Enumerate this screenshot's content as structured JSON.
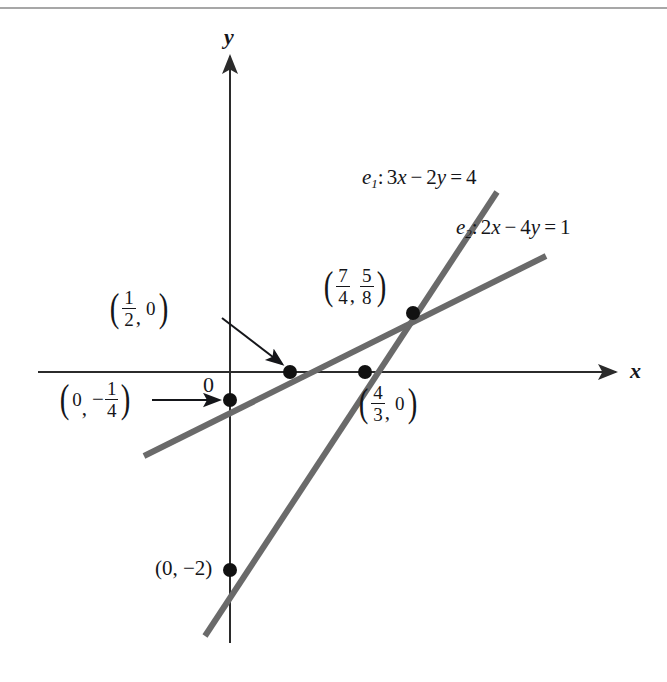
{
  "figure": {
    "type": "coordinate-geometry-diagram",
    "width": 667,
    "height": 682,
    "background": "#ffffff",
    "line_color": "#6a6a6a",
    "axis_color": "#2b2b2b",
    "point_color": "#111111",
    "text_color": "#15161a"
  },
  "axes": {
    "x_label": "x",
    "y_label": "y",
    "origin_label": "0",
    "origin_px": {
      "x": 230,
      "y": 372
    },
    "x_axis_px": {
      "x1": 38,
      "y1": 372,
      "x2": 620,
      "y2": 372
    },
    "y_axis_px": {
      "x1": 230,
      "y1": 52,
      "x2": 230,
      "y2": 643
    }
  },
  "lines": [
    {
      "id": "e1",
      "name": "e_1",
      "subscript": "1",
      "equation_parts": {
        "coef_x": "3",
        "var_x": "x",
        "operator": "−",
        "coef_y": "2",
        "var_y": "y",
        "equals": "=",
        "rhs": "4"
      },
      "equation_text": "e₁: 3x − 2y = 4",
      "label_px": {
        "x": 362,
        "y": 178
      },
      "endpoints_px": {
        "x1": 205,
        "y1": 636,
        "x2": 497,
        "y2": 192
      }
    },
    {
      "id": "e2",
      "name": "e_2",
      "subscript": "2",
      "equation_parts": {
        "coef_x": "2",
        "var_x": "x",
        "operator": "−",
        "coef_y": "4",
        "var_y": "y",
        "equals": "=",
        "rhs": "1"
      },
      "equation_text": "e₂: 2x − 4y = 1",
      "label_px": {
        "x": 456,
        "y": 228
      },
      "endpoints_px": {
        "x1": 144,
        "y1": 456,
        "x2": 546,
        "y2": 256
      }
    }
  ],
  "points": [
    {
      "id": "intersection",
      "label_text": "(7/4, 5/8)",
      "x_value": {
        "numerator": "7",
        "denominator": "4"
      },
      "y_value": {
        "numerator": "5",
        "denominator": "8"
      },
      "point_px": {
        "x": 413,
        "y": 313
      },
      "label_px": {
        "x": 322,
        "y": 266
      },
      "has_arrow": false
    },
    {
      "id": "x-intercept-e2",
      "label_text": "(1/2, 0)",
      "x_value": {
        "numerator": "1",
        "denominator": "2"
      },
      "y_value": "0",
      "point_px": {
        "x": 290,
        "y": 372
      },
      "label_px": {
        "x": 108,
        "y": 290
      },
      "has_arrow": true,
      "arrow_px": {
        "x1": 222,
        "y1": 318,
        "x2": 284,
        "y2": 366
      }
    },
    {
      "id": "x-intercept-e1",
      "label_text": "(4/3, 0)",
      "x_value": {
        "numerator": "4",
        "denominator": "3"
      },
      "y_value": "0",
      "point_px": {
        "x": 365,
        "y": 372
      },
      "label_px": {
        "x": 357,
        "y": 385
      },
      "has_arrow": false
    },
    {
      "id": "y-intercept-e2",
      "label_text": "(0, -1/4)",
      "x_value": "0",
      "y_value": {
        "sign": "−",
        "numerator": "1",
        "denominator": "4"
      },
      "point_px": {
        "x": 230,
        "y": 400
      },
      "label_px": {
        "x": 58,
        "y": 381
      },
      "has_arrow": true,
      "arrow_px": {
        "x1": 155,
        "y1": 400,
        "x2": 222,
        "y2": 400
      }
    },
    {
      "id": "y-intercept-e1",
      "label_text": "(0, −2)",
      "x_value": "0",
      "y_value": "−2",
      "point_px": {
        "x": 230,
        "y": 570
      },
      "label_px": {
        "x": 155,
        "y": 558
      },
      "has_arrow": false
    }
  ],
  "top_rule": {
    "y": 8,
    "color": "#8a8a8a"
  },
  "glyphs": {
    "minus": "−",
    "equals": "=",
    "comma": ",",
    "colon": ":",
    "zero": "0",
    "neg_two": "−2"
  }
}
